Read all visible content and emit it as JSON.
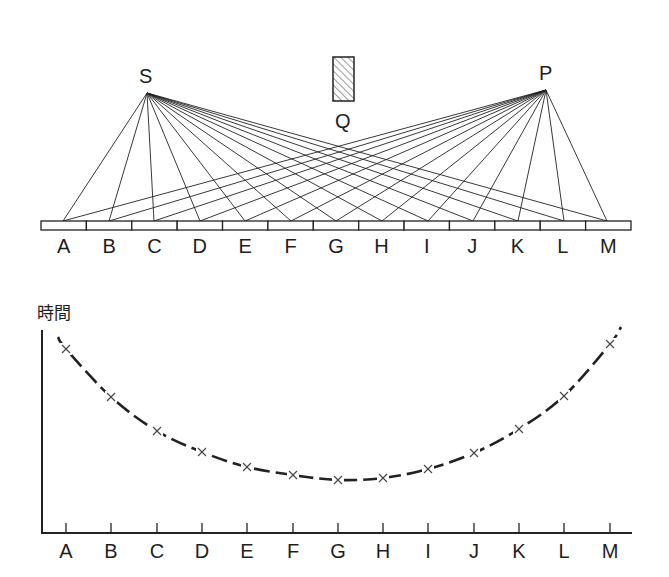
{
  "figure": {
    "top_diagram": {
      "source_label": "S",
      "receiver_label": "P",
      "obstacle_label": "Q",
      "source_point": [
        147,
        93
      ],
      "receiver_point": [
        546,
        90
      ],
      "obstacle_rect": {
        "x": 333,
        "y": 57,
        "w": 21,
        "h": 44
      },
      "strip": {
        "x0": 41,
        "x1": 631,
        "y0": 221,
        "y1": 230,
        "segments": 13
      },
      "points": [
        {
          "label": "A",
          "x": 63
        },
        {
          "label": "B",
          "x": 109
        },
        {
          "label": "C",
          "x": 154
        },
        {
          "label": "D",
          "x": 200
        },
        {
          "label": "E",
          "x": 245
        },
        {
          "label": "F",
          "x": 291
        },
        {
          "label": "G",
          "x": 336
        },
        {
          "label": "H",
          "x": 382
        },
        {
          "label": "I",
          "x": 428
        },
        {
          "label": "J",
          "x": 473
        },
        {
          "label": "K",
          "x": 518
        },
        {
          "label": "L",
          "x": 564
        },
        {
          "label": "M",
          "x": 607
        }
      ]
    },
    "graph": {
      "ylabel": "時間",
      "axis": {
        "x0": 42,
        "y_top": 330,
        "y_axis": 533,
        "x_end": 632
      }
    }
  },
  "chart_data": {
    "type": "scatter",
    "title": "",
    "xlabel": "",
    "ylabel": "時間",
    "categories": [
      "A",
      "B",
      "C",
      "D",
      "E",
      "F",
      "G",
      "H",
      "I",
      "J",
      "K",
      "L",
      "M"
    ],
    "x_pixels": [
      66,
      111,
      157,
      202,
      247,
      293,
      338,
      383,
      428,
      474,
      519,
      564,
      610
    ],
    "y_pixels": [
      349,
      397,
      431,
      452,
      467,
      475,
      480,
      478,
      469,
      453,
      429,
      396,
      344
    ],
    "values_relative": [
      184,
      136,
      102,
      81,
      66,
      58,
      53,
      55,
      64,
      80,
      104,
      137,
      189
    ],
    "marker": "x",
    "fit_curve": "dashed U-shaped curve (minimum near G–H)",
    "grid": false,
    "legend": null
  }
}
